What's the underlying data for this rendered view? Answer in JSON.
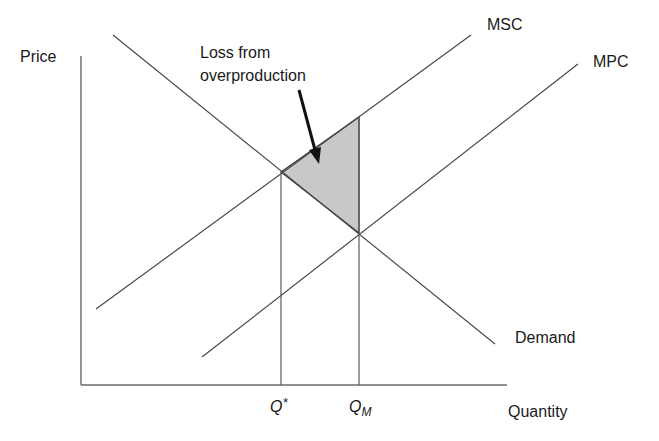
{
  "diagram": {
    "axes": {
      "y_label": "Price",
      "x_label": "Quantity"
    },
    "curves": [
      {
        "id": "msc",
        "label": "MSC",
        "type": "upward",
        "color": "#4a4a4a"
      },
      {
        "id": "mpc",
        "label": "MPC",
        "type": "upward",
        "color": "#4a4a4a"
      },
      {
        "id": "demand",
        "label": "Demand",
        "type": "downward",
        "color": "#4a4a4a"
      }
    ],
    "quantities": {
      "q_star": {
        "label": "Q",
        "suffix": "*"
      },
      "q_m": {
        "label": "Q",
        "subscript": "M"
      }
    },
    "annotation": {
      "line1": "Loss from",
      "line2": "overproduction"
    },
    "shaded_region": {
      "description": "Deadweight loss triangle between MSC and Demand from Q* to QM",
      "fill": "#c8c8c8"
    }
  }
}
